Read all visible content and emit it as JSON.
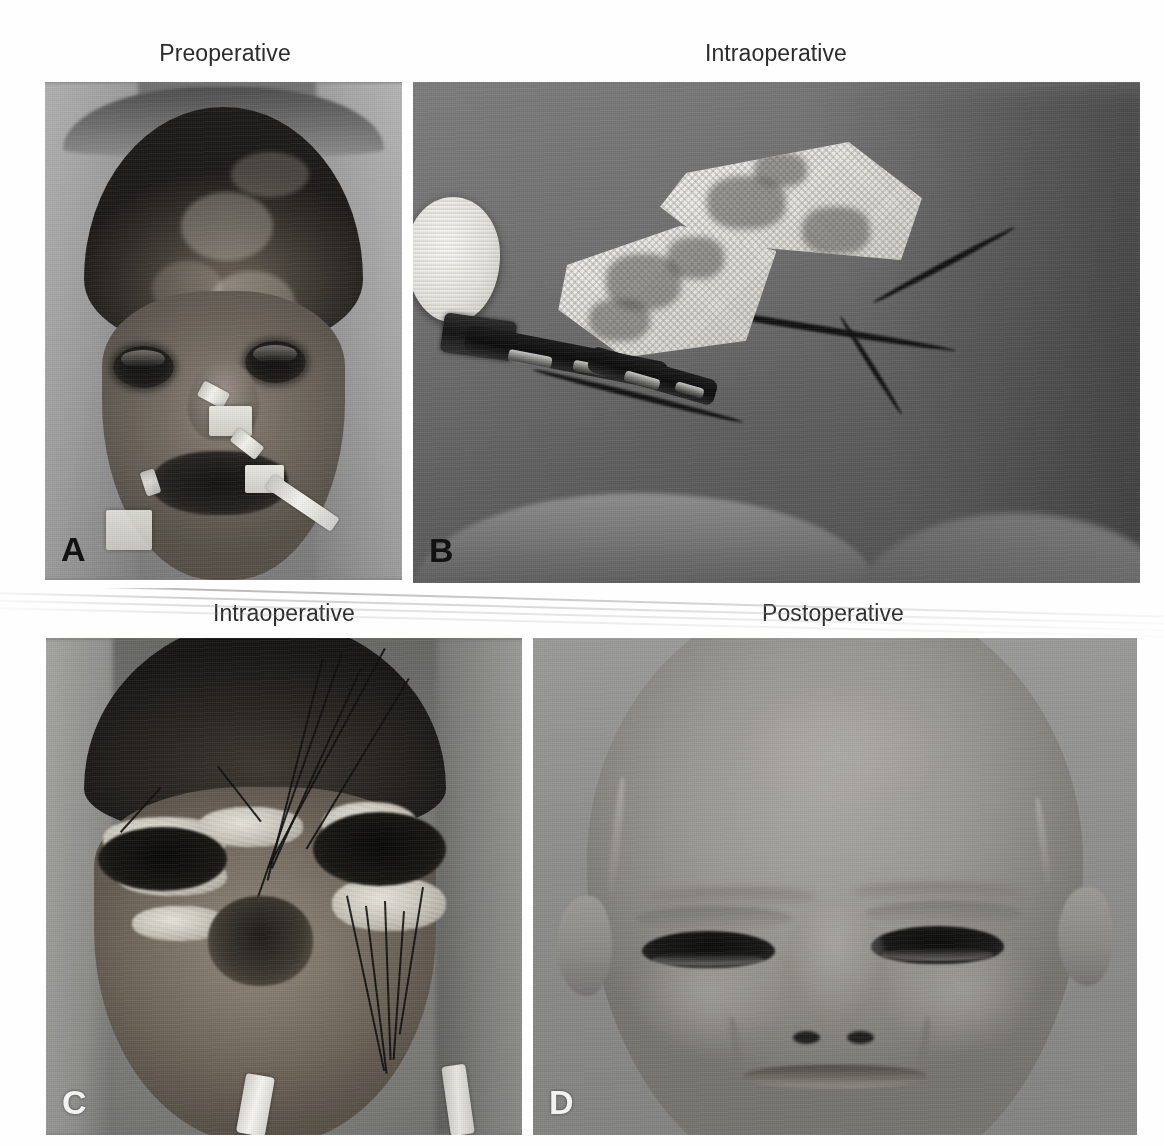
{
  "figure": {
    "layout": "2x2 grid of grayscale clinical photographs with column captions above each row",
    "background_color": "#ffffff",
    "caption_color": "#2b2b2b",
    "panel_count": 4
  },
  "captions": {
    "row1_left": "Preoperative",
    "row1_right": "Intraoperative",
    "row2_left": "Intraoperative",
    "row2_right": "Postoperative"
  },
  "panels": [
    {
      "letter": "A",
      "letter_style": "dark",
      "caption": "Preoperative",
      "position": "top-left",
      "subject": "frontal view of face with extensive full-thickness burn eschar over forehead, scalp and periorbital region",
      "visible_devices": [
        "nasogastric-tube",
        "endotracheal-tube",
        "tube-securing-tape",
        "head-strap"
      ],
      "dominant_tone": "dark-charred"
    },
    {
      "letter": "B",
      "letter_style": "dark",
      "caption": "Intraoperative",
      "position": "top-right",
      "subject": "donor site on trunk with white gauze dressing packs, surgical sponge and suction tubing over a surgical incision",
      "visible_devices": [
        "gauze-dressing",
        "surgical-sponge",
        "suction-tubing",
        "tube-connector",
        "surgical-drape"
      ],
      "dominant_tone": "mid-gray"
    },
    {
      "letter": "C",
      "letter_style": "light",
      "caption": "Intraoperative",
      "position": "bottom-left",
      "subject": "frontal view after debridement and graft inset with multiple interrupted sutures around both orbits",
      "visible_devices": [
        "sutures",
        "skin-graft",
        "nasogastric-tube",
        "surgical-drape"
      ],
      "dominant_tone": "dark-with-highlights"
    },
    {
      "letter": "D",
      "letter_style": "light",
      "caption": "Postoperative",
      "position": "bottom-right",
      "subject": "healed frontal view showing resurfaced forehead, eyelids and cheeks with mature graft",
      "visible_devices": [],
      "dominant_tone": "uniform-light-gray"
    }
  ]
}
